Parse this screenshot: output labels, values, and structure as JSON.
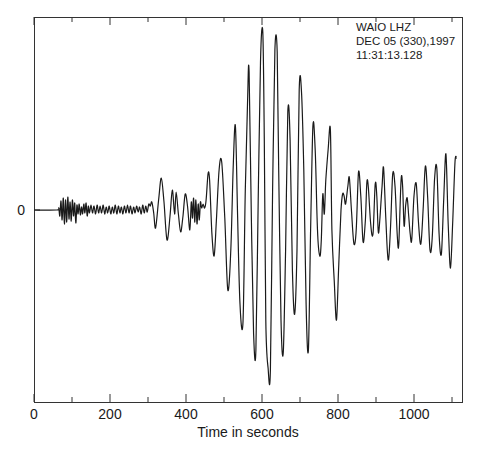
{
  "chart_data": {
    "type": "line",
    "title": "",
    "annotation": [
      "WAIO  LHZ",
      "DEC 05 (330),1997",
      "11:31:13.128"
    ],
    "xlabel": "Time in seconds",
    "ylabel": "",
    "xlim": [
      0,
      1120
    ],
    "x_major_ticks": [
      0,
      200,
      400,
      600,
      800,
      1000
    ],
    "x_minor_ticks": [
      100,
      300,
      500,
      700,
      900,
      1100
    ],
    "y_tick_labels": [
      {
        "value": 0,
        "label": "0"
      }
    ],
    "grid": false,
    "legend": null,
    "series": [
      {
        "name": "WAIO LHZ vertical long-period seismogram",
        "note": "relative amplitude in plot units (positive = up); x in seconds",
        "points": [
          [
            0,
            0
          ],
          [
            60,
            0
          ],
          [
            65,
            2
          ],
          [
            68,
            -6
          ],
          [
            71,
            9
          ],
          [
            74,
            -10
          ],
          [
            77,
            12
          ],
          [
            80,
            -14
          ],
          [
            83,
            10
          ],
          [
            86,
            -12
          ],
          [
            89,
            13
          ],
          [
            92,
            -9
          ],
          [
            95,
            8
          ],
          [
            98,
            -11
          ],
          [
            101,
            10
          ],
          [
            104,
            -6
          ],
          [
            107,
            7
          ],
          [
            110,
            -13
          ],
          [
            113,
            5
          ],
          [
            116,
            -4
          ],
          [
            119,
            6
          ],
          [
            122,
            -5
          ],
          [
            125,
            3
          ],
          [
            128,
            -4
          ],
          [
            131,
            6
          ],
          [
            134,
            -3
          ],
          [
            137,
            7
          ],
          [
            140,
            -6
          ],
          [
            143,
            4
          ],
          [
            146,
            -3
          ],
          [
            150,
            5
          ],
          [
            154,
            -3
          ],
          [
            158,
            4
          ],
          [
            162,
            -4
          ],
          [
            166,
            5
          ],
          [
            170,
            -3
          ],
          [
            174,
            4
          ],
          [
            178,
            -3
          ],
          [
            182,
            5
          ],
          [
            186,
            -4
          ],
          [
            190,
            3
          ],
          [
            194,
            -3
          ],
          [
            198,
            4
          ],
          [
            202,
            -4
          ],
          [
            206,
            3
          ],
          [
            210,
            -3
          ],
          [
            214,
            5
          ],
          [
            218,
            -4
          ],
          [
            222,
            4
          ],
          [
            226,
            -3
          ],
          [
            230,
            3
          ],
          [
            234,
            -4
          ],
          [
            238,
            4
          ],
          [
            242,
            -3
          ],
          [
            246,
            5
          ],
          [
            250,
            -3
          ],
          [
            254,
            4
          ],
          [
            258,
            -4
          ],
          [
            262,
            3
          ],
          [
            266,
            -3
          ],
          [
            270,
            4
          ],
          [
            274,
            -2
          ],
          [
            278,
            3
          ],
          [
            282,
            -4
          ],
          [
            286,
            5
          ],
          [
            290,
            -3
          ],
          [
            294,
            4
          ],
          [
            298,
            -2
          ],
          [
            302,
            6
          ],
          [
            306,
            4
          ],
          [
            310,
            8
          ],
          [
            315,
            -3
          ],
          [
            320,
            -18
          ],
          [
            328,
            10
          ],
          [
            335,
            32
          ],
          [
            342,
            8
          ],
          [
            350,
            -30
          ],
          [
            358,
            -6
          ],
          [
            364,
            20
          ],
          [
            370,
            -4
          ],
          [
            374,
            18
          ],
          [
            380,
            -4
          ],
          [
            386,
            -22
          ],
          [
            392,
            -6
          ],
          [
            398,
            16
          ],
          [
            404,
            4
          ],
          [
            410,
            -20
          ],
          [
            414,
            8
          ],
          [
            417,
            -8
          ],
          [
            420,
            12
          ],
          [
            423,
            -12
          ],
          [
            426,
            10
          ],
          [
            429,
            -14
          ],
          [
            432,
            6
          ],
          [
            435,
            -10
          ],
          [
            438,
            8
          ],
          [
            441,
            2
          ],
          [
            445,
            6
          ],
          [
            449,
            2
          ],
          [
            453,
            10
          ],
          [
            458,
            36
          ],
          [
            462,
            30
          ],
          [
            468,
            -22
          ],
          [
            474,
            -46
          ],
          [
            480,
            -10
          ],
          [
            487,
            40
          ],
          [
            494,
            48
          ],
          [
            502,
            -8
          ],
          [
            510,
            -80
          ],
          [
            518,
            -40
          ],
          [
            524,
            40
          ],
          [
            530,
            84
          ],
          [
            536,
            -10
          ],
          [
            542,
            -94
          ],
          [
            550,
            -112
          ],
          [
            556,
            20
          ],
          [
            562,
            110
          ],
          [
            566,
            138
          ],
          [
            572,
            -10
          ],
          [
            578,
            -124
          ],
          [
            584,
            -140
          ],
          [
            590,
            10
          ],
          [
            596,
            148
          ],
          [
            602,
            178
          ],
          [
            606,
            70
          ],
          [
            610,
            -110
          ],
          [
            616,
            -158
          ],
          [
            622,
            -160
          ],
          [
            628,
            20
          ],
          [
            634,
            160
          ],
          [
            640,
            158
          ],
          [
            644,
            40
          ],
          [
            650,
            -110
          ],
          [
            656,
            -142
          ],
          [
            662,
            -40
          ],
          [
            668,
            98
          ],
          [
            674,
            70
          ],
          [
            680,
            -60
          ],
          [
            686,
            -104
          ],
          [
            692,
            -40
          ],
          [
            698,
            120
          ],
          [
            704,
            118
          ],
          [
            710,
            40
          ],
          [
            716,
            -94
          ],
          [
            722,
            -140
          ],
          [
            728,
            -20
          ],
          [
            734,
            84
          ],
          [
            740,
            60
          ],
          [
            746,
            -20
          ],
          [
            752,
            -46
          ],
          [
            756,
            -30
          ],
          [
            760,
            16
          ],
          [
            764,
            -4
          ],
          [
            768,
            30
          ],
          [
            774,
            60
          ],
          [
            780,
            80
          ],
          [
            784,
            -20
          ],
          [
            790,
            -70
          ],
          [
            796,
            -110
          ],
          [
            802,
            -54
          ],
          [
            808,
            0
          ],
          [
            812,
            16
          ],
          [
            816,
            14
          ],
          [
            820,
            6
          ],
          [
            826,
            24
          ],
          [
            830,
            32
          ],
          [
            836,
            -4
          ],
          [
            842,
            -34
          ],
          [
            848,
            -20
          ],
          [
            854,
            38
          ],
          [
            860,
            14
          ],
          [
            866,
            -32
          ],
          [
            872,
            -10
          ],
          [
            876,
            28
          ],
          [
            880,
            22
          ],
          [
            886,
            -14
          ],
          [
            892,
            -24
          ],
          [
            898,
            26
          ],
          [
            902,
            14
          ],
          [
            906,
            -22
          ],
          [
            910,
            -10
          ],
          [
            916,
            24
          ],
          [
            920,
            42
          ],
          [
            926,
            -10
          ],
          [
            932,
            -50
          ],
          [
            938,
            -20
          ],
          [
            944,
            36
          ],
          [
            950,
            24
          ],
          [
            956,
            -26
          ],
          [
            960,
            -34
          ],
          [
            966,
            30
          ],
          [
            970,
            24
          ],
          [
            974,
            -16
          ],
          [
            978,
            4
          ],
          [
            982,
            12
          ],
          [
            986,
            -6
          ],
          [
            990,
            -24
          ],
          [
            994,
            -30
          ],
          [
            1000,
            14
          ],
          [
            1006,
            26
          ],
          [
            1012,
            -14
          ],
          [
            1018,
            -34
          ],
          [
            1024,
            0
          ],
          [
            1030,
            44
          ],
          [
            1036,
            12
          ],
          [
            1042,
            -40
          ],
          [
            1048,
            -28
          ],
          [
            1054,
            30
          ],
          [
            1060,
            42
          ],
          [
            1066,
            -24
          ],
          [
            1072,
            -44
          ],
          [
            1078,
            8
          ],
          [
            1084,
            56
          ],
          [
            1090,
            -14
          ],
          [
            1096,
            -58
          ],
          [
            1102,
            -10
          ],
          [
            1108,
            48
          ],
          [
            1112,
            52
          ]
        ]
      }
    ]
  }
}
